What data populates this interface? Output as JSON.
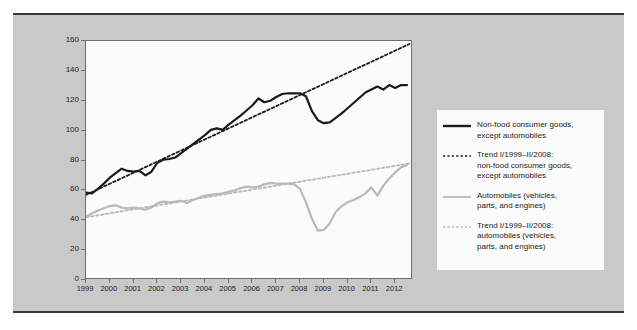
{
  "chart_data": {
    "type": "line",
    "title": "",
    "xlabel": "",
    "ylabel": "",
    "grid": false,
    "legend_position": "right",
    "ylim": [
      0,
      160
    ],
    "yticks": [
      0,
      20,
      40,
      60,
      80,
      100,
      120,
      140,
      160
    ],
    "xlim": [
      1999,
      2012.75
    ],
    "xticks": [
      1999,
      2000,
      2001,
      2002,
      2003,
      2004,
      2005,
      2006,
      2007,
      2008,
      2009,
      2010,
      2011,
      2012
    ],
    "xticklabels": [
      "1999",
      "2000",
      "2001",
      "2002",
      "2003",
      "2004",
      "2005",
      "2006",
      "2007",
      "2008",
      "2009",
      "2010",
      "2011",
      "2012"
    ],
    "series": [
      {
        "name": "Non-food consumer goods, except automobiles",
        "style": "solid",
        "color": "#1b1b1b",
        "width": 2.2,
        "x": [
          1999.0,
          1999.25,
          1999.5,
          1999.75,
          2000.0,
          2000.25,
          2000.5,
          2000.75,
          2001.0,
          2001.25,
          2001.5,
          2001.75,
          2002.0,
          2002.25,
          2002.5,
          2002.75,
          2003.0,
          2003.25,
          2003.5,
          2003.75,
          2004.0,
          2004.25,
          2004.5,
          2004.75,
          2005.0,
          2005.25,
          2005.5,
          2005.75,
          2006.0,
          2006.25,
          2006.5,
          2006.75,
          2007.0,
          2007.25,
          2007.5,
          2007.75,
          2008.0,
          2008.25,
          2008.5,
          2008.75,
          2009.0,
          2009.25,
          2009.5,
          2009.75,
          2010.0,
          2010.25,
          2010.5,
          2010.75,
          2011.0,
          2011.25,
          2011.5,
          2011.75,
          2012.0,
          2012.25,
          2012.5
        ],
        "y": [
          58.5,
          58.0,
          61.0,
          64.5,
          68.5,
          71.5,
          74.5,
          73.0,
          72.5,
          73.0,
          70.0,
          72.5,
          78.5,
          80.5,
          81.0,
          82.0,
          85.0,
          88.0,
          91.0,
          94.0,
          97.0,
          100.5,
          101.5,
          100.5,
          104.0,
          107.0,
          110.0,
          113.5,
          117.0,
          121.5,
          119.0,
          120.0,
          122.5,
          124.5,
          125.0,
          125.0,
          125.0,
          123.0,
          113.0,
          107.0,
          105.0,
          105.5,
          108.5,
          111.5,
          115.0,
          118.5,
          122.0,
          125.5,
          127.5,
          129.5,
          127.5,
          130.5,
          128.5,
          130.5,
          130.5
        ]
      },
      {
        "name": "Trend I/1999–II/2008: non-food consumer goods, except automobiles",
        "style": "dotted",
        "color": "#1b1b1b",
        "width": 1.8,
        "x": [
          1999.0,
          2012.6
        ],
        "y": [
          57.0,
          158.0
        ]
      },
      {
        "name": "Automobiles (vehicles, parts, and engines)",
        "style": "solid",
        "color": "#b9b9b9",
        "width": 2.2,
        "x": [
          1999.0,
          1999.25,
          1999.5,
          1999.75,
          2000.0,
          2000.25,
          2000.5,
          2000.75,
          2001.0,
          2001.25,
          2001.5,
          2001.75,
          2002.0,
          2002.25,
          2002.5,
          2002.75,
          2003.0,
          2003.25,
          2003.5,
          2003.75,
          2004.0,
          2004.25,
          2004.5,
          2004.75,
          2005.0,
          2005.25,
          2005.5,
          2005.75,
          2006.0,
          2006.25,
          2006.5,
          2006.75,
          2007.0,
          2007.25,
          2007.5,
          2007.75,
          2008.0,
          2008.25,
          2008.5,
          2008.75,
          2009.0,
          2009.25,
          2009.5,
          2009.75,
          2010.0,
          2010.25,
          2010.5,
          2010.75,
          2011.0,
          2011.25,
          2011.5,
          2011.75,
          2012.0,
          2012.25,
          2012.5
        ],
        "y": [
          42.5,
          44.5,
          46.5,
          48.0,
          49.5,
          50.0,
          48.5,
          48.0,
          48.5,
          48.0,
          47.0,
          48.5,
          51.5,
          52.5,
          52.0,
          52.5,
          53.0,
          51.5,
          53.5,
          55.0,
          56.5,
          57.0,
          57.5,
          58.0,
          59.0,
          60.0,
          61.5,
          62.5,
          62.0,
          62.5,
          64.0,
          65.0,
          64.5,
          64.5,
          64.5,
          64.0,
          61.0,
          52.0,
          41.0,
          33.0,
          33.5,
          38.0,
          45.5,
          49.5,
          52.0,
          53.5,
          55.5,
          58.0,
          62.0,
          56.5,
          63.0,
          68.0,
          72.0,
          75.5,
          77.0
        ]
      },
      {
        "name": "Trend I/1999–II/2008: automobiles (vehicles, parts, and engines)",
        "style": "dotted",
        "color": "#b9b9b9",
        "width": 1.8,
        "x": [
          1999.0,
          2012.6
        ],
        "y": [
          42.0,
          78.0
        ]
      }
    ]
  },
  "legend": {
    "items": [
      {
        "label_line1": "Non-food consumer goods,",
        "label_line2": "except automobiles",
        "label_line3": "",
        "style": "solid",
        "color": "#1b1b1b"
      },
      {
        "label_line1": "Trend I/1999–II/2008:",
        "label_line2": "non-food consumer goods,",
        "label_line3": "except automobiles",
        "style": "dotted",
        "color": "#1b1b1b"
      },
      {
        "label_line1": "Automobiles (vehicles,",
        "label_line2": "parts, and engines)",
        "label_line3": "",
        "style": "solid",
        "color": "#b9b9b9"
      },
      {
        "label_line1": "Trend I/1999–II/2008:",
        "label_line2": "automobiles (vehicles,",
        "label_line3": "parts, and engines)",
        "style": "dotted",
        "color": "#b9b9b9"
      }
    ]
  },
  "colors": {
    "page_background": "#ffffff",
    "figure_background": "#c9c9c9",
    "plot_background": "#fbfbfb",
    "axis": "#6f6f6f",
    "text": "#1b1b1b",
    "series_dark": "#1b1b1b",
    "series_light": "#b9b9b9"
  }
}
